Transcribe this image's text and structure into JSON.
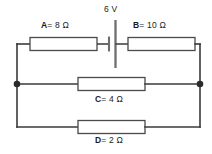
{
  "diagram": {
    "line_color": "#3a3a3a",
    "box_color": "#4a4a4a",
    "node_color": "#2b2b2b",
    "battery_color": "#6e6e6e",
    "background": "#ffffff"
  },
  "source": {
    "name": "battery",
    "label": "6 V",
    "voltage_value": "6",
    "voltage_unit": "V",
    "branch": "top"
  },
  "components": [
    {
      "id": "A",
      "letter": "A",
      "relation": "= 8 Ω",
      "label": "A = 8 Ω",
      "resistance_value": "8",
      "resistance_unit": "Ω",
      "branch": "top",
      "label_position": "above"
    },
    {
      "id": "B",
      "letter": "B",
      "relation": "= 10 Ω",
      "label": "B = 10 Ω",
      "resistance_value": "10",
      "resistance_unit": "Ω",
      "branch": "top",
      "label_position": "above"
    },
    {
      "id": "C",
      "letter": "C",
      "relation": "= 4 Ω",
      "label": "C = 4 Ω",
      "resistance_value": "4",
      "resistance_unit": "Ω",
      "branch": "middle",
      "label_position": "below"
    },
    {
      "id": "D",
      "letter": "D",
      "relation": "= 2 Ω",
      "label": "D = 2 Ω",
      "resistance_value": "2",
      "resistance_unit": "Ω",
      "branch": "bottom",
      "label_position": "below"
    }
  ],
  "nodes": [
    {
      "name": "left-junction",
      "x": 17,
      "y": 84
    },
    {
      "name": "right-junction",
      "x": 200,
      "y": 84
    }
  ]
}
